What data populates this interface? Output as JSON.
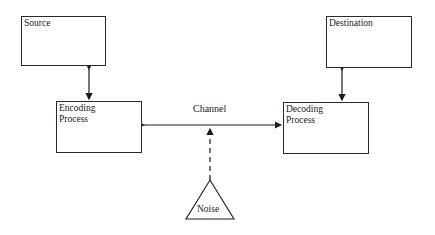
{
  "diagram": {
    "nodes": {
      "source": {
        "label": "Source"
      },
      "destination": {
        "label": "Destination"
      },
      "encoding": {
        "line1": "Encoding",
        "line2": "Process"
      },
      "decoding": {
        "line1": "Decoding",
        "line2": "Process"
      },
      "noise": {
        "label": "Noise"
      }
    },
    "channel_label": "Channel",
    "edges": [
      {
        "from": "source",
        "to": "encoding",
        "style": "solid",
        "arrows": "both"
      },
      {
        "from": "destination",
        "to": "decoding",
        "style": "solid",
        "arrows": "both"
      },
      {
        "from": "encoding",
        "to": "decoding",
        "style": "solid",
        "arrows": "both",
        "label": "Channel"
      },
      {
        "from": "noise",
        "to": "channel",
        "style": "dashed",
        "arrows": "end"
      }
    ]
  }
}
